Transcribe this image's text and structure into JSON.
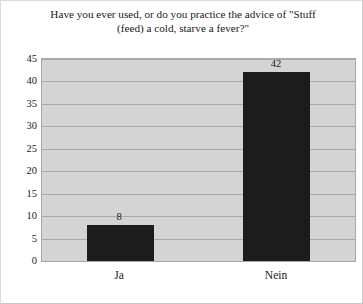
{
  "chart_data": {
    "type": "bar",
    "title": "Have you ever used, or do you practice the advice of \"Stuff (feed) a cold, starve a fever?\"",
    "title_line1": "Have you ever used, or do you practice the advice of \"Stuff",
    "title_line2": "(feed) a cold, starve a fever?\"",
    "categories": [
      "Ja",
      "Nein"
    ],
    "values": [
      8,
      42
    ],
    "value_labels": [
      "8",
      "42"
    ],
    "xlabel": "",
    "ylabel": "",
    "ylim": [
      0,
      45
    ],
    "yticks": [
      0,
      5,
      10,
      15,
      20,
      25,
      30,
      35,
      40,
      45
    ],
    "ytick_labels": [
      "0",
      "5",
      "10",
      "15",
      "20",
      "25",
      "30",
      "35",
      "40",
      "45"
    ],
    "grid": true,
    "grid_axis": "y",
    "legend": false,
    "bar_color": "#1c1c1c",
    "plot_background": "#d4d4d4",
    "figure_background": "#ffffff",
    "gridline_color": "#a9a9a9",
    "axis_color": "#a8a8a8"
  }
}
